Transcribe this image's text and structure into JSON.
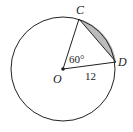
{
  "diagram": {
    "type": "circle-segment",
    "points": {
      "center": {
        "label": "O"
      },
      "c": {
        "label": "C"
      },
      "d": {
        "label": "D"
      }
    },
    "angle_label": "60°",
    "radius_label": "12",
    "shaded_region": "segment between chord CD and arc CD",
    "colors": {
      "stroke": "#222222",
      "shade": "#bbbbbb",
      "background": "#ffffff"
    }
  }
}
